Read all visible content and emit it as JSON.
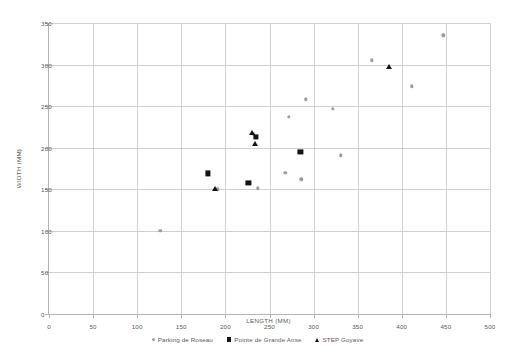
{
  "chart_data": {
    "type": "scatter",
    "title": "",
    "xlabel": "LENGTH (MM)",
    "ylabel": "WIDTH (MM)",
    "xlim": [
      0,
      500
    ],
    "ylim": [
      0,
      350
    ],
    "xticks": [
      0,
      50,
      100,
      150,
      200,
      250,
      300,
      350,
      400,
      450,
      500
    ],
    "yticks": [
      0,
      50,
      100,
      150,
      200,
      250,
      300,
      350
    ],
    "grid": true,
    "legend_position": "bottom",
    "series": [
      {
        "name": "Parking de Roseau",
        "marker": "circle",
        "color": "#9b9b9b",
        "points": [
          [
            126,
            100
          ],
          [
            191,
            150
          ],
          [
            232,
            216
          ],
          [
            237,
            151
          ],
          [
            268,
            170
          ],
          [
            272,
            237
          ],
          [
            286,
            162
          ],
          [
            291,
            258
          ],
          [
            322,
            247
          ],
          [
            331,
            191
          ],
          [
            366,
            305
          ],
          [
            411,
            274
          ],
          [
            447,
            335
          ]
        ]
      },
      {
        "name": "Pointe de Grande Anse",
        "marker": "square",
        "color": "#141414",
        "points": [
          [
            180,
            169
          ],
          [
            226,
            158
          ],
          [
            235,
            213
          ],
          [
            285,
            195
          ]
        ]
      },
      {
        "name": "STEP Goyave",
        "marker": "triangle",
        "color": "#141414",
        "points": [
          [
            188,
            150
          ],
          [
            230,
            218
          ],
          [
            233,
            204
          ],
          [
            385,
            297
          ]
        ]
      }
    ]
  },
  "legend": {
    "items": [
      {
        "label": "Parking de Roseau",
        "marker": "circle"
      },
      {
        "label": "Pointe de Grande Anse",
        "marker": "square"
      },
      {
        "label": "STEP Goyave",
        "marker": "triangle"
      }
    ]
  }
}
